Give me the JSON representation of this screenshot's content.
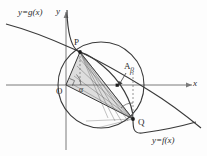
{
  "figure": {
    "background_color": "#fdfdfd",
    "stroke_color": "#2b2b2b",
    "axis_color": "#6d6d6d",
    "shade_color": "#d9d9d9",
    "labels": {
      "g_curve": "y=g(x)",
      "f_curve": "y=f(x)",
      "y_axis": "y",
      "x_axis": "x",
      "origin": "O",
      "point_p": "P",
      "point_q": "Q",
      "point_a": "A",
      "angle_alpha": "α",
      "angle_beta": "β"
    },
    "geometry": {
      "origin_px": [
        66,
        85
      ],
      "point_p_px": [
        80,
        52
      ],
      "point_q_px": [
        133,
        119
      ],
      "point_a_px": [
        118,
        86
      ],
      "circle_center_px": [
        101,
        85
      ],
      "circle_radius_px": 43
    }
  }
}
